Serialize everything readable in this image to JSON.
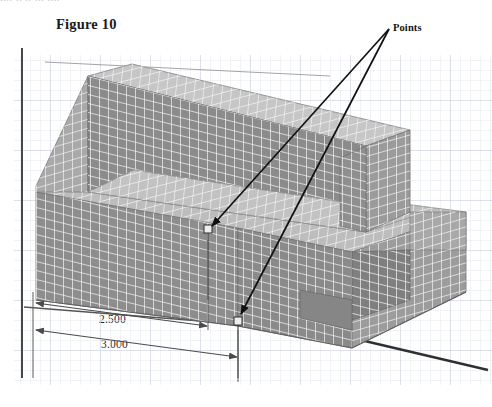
{
  "document": {
    "top_cutoff_sliver": "....   ..  ..  ...    ....",
    "figure_caption": "Figure 10"
  },
  "annotations": {
    "points_label": "Points",
    "leader_origin": {
      "x": 389,
      "y": 29
    },
    "targets": [
      {
        "name": "point-upper-step-edge",
        "x": 208,
        "y": 230
      },
      {
        "name": "point-lower-front-edge",
        "x": 238,
        "y": 322
      }
    ]
  },
  "dimensions": [
    {
      "name": "dim-2500",
      "value": "2.500",
      "label_x": 98,
      "label_y": 313
    },
    {
      "name": "dim-3000",
      "value": "3.000",
      "label_x": 100,
      "label_y": 338
    }
  ],
  "colors": {
    "background": "#ffffff",
    "grid_minor": "#e3e6ee",
    "grid_major": "#c8ccd8",
    "axis_line": "#3b3b3b",
    "mesh_line": "#f0f0f0",
    "face_top_light": "#b9b9b9",
    "face_front_dark": "#8f8f8f",
    "face_side_mid": "#a5a5a5",
    "face_shadow": "#7d7d7d",
    "leader_line": "#111111",
    "dim_line": "#4a4a4a",
    "text": "#1b1b1b"
  },
  "viewport": {
    "width": 492,
    "height": 407,
    "grid_region": {
      "x": 14,
      "y": 55,
      "width": 478,
      "height": 330
    },
    "grid_minor_step": 10,
    "grid_major_every": 5
  },
  "model": {
    "type": "3d-meshed-solid",
    "description": "Stepped T-section solid with finite-element surface mesh shown in isometric view",
    "mesh_visible": true
  }
}
